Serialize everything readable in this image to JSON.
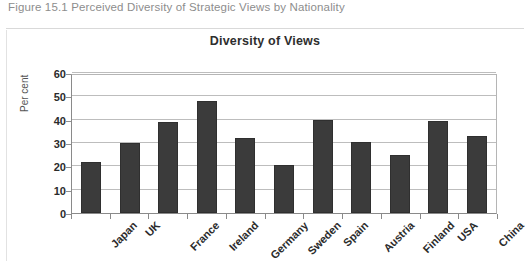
{
  "figure": {
    "caption": "Figure 15.1 Perceived Diversity of Strategic Views by Nationality"
  },
  "chart_data": {
    "type": "bar",
    "title": "Diversity of Views",
    "xlabel": "",
    "ylabel": "Per cent",
    "categories": [
      "Japan",
      "UK",
      "France",
      "Ireland",
      "Germany",
      "Sweden",
      "Spain",
      "Austria",
      "Finland",
      "USA",
      "China"
    ],
    "values": [
      22,
      30,
      39,
      48,
      32,
      20.5,
      40,
      30.5,
      25,
      39.5,
      33
    ],
    "ylim": [
      0,
      60
    ],
    "yticks": [
      0,
      10,
      20,
      30,
      40,
      50,
      60
    ],
    "ytick_labels": [
      "0",
      "10",
      "20",
      "30",
      "40",
      "50",
      "60"
    ],
    "grid": "horizontal",
    "legend": "none",
    "bar_color": "#3b3b3b",
    "gridline_color": "#bdbdbd",
    "axis_color": "#8a8a8a"
  }
}
